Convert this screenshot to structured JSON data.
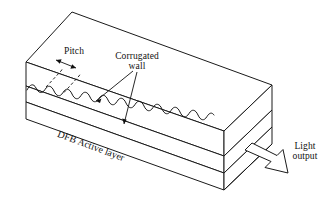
{
  "figure": {
    "kind": "technical-line-diagram",
    "background_color": "#ffffff",
    "line_color": "#1a1a1a"
  },
  "labels": {
    "pitch": "Pitch",
    "corrugated_line1": "Corrugated",
    "corrugated_line2": "wall",
    "active_layer": "DFB Active layer",
    "light_line1": "Light",
    "light_line2": "output"
  },
  "annotations": {
    "pitch_marker": "double-headed-arrow-between-dashed-guides",
    "corrugated_leaders": 2,
    "light_output_arrow": "hollow-block-arrow-pointing-down-right"
  },
  "geometry": {
    "corrugation_cycles": 11,
    "slab_layers": 3,
    "projection": "oblique-isometric"
  }
}
